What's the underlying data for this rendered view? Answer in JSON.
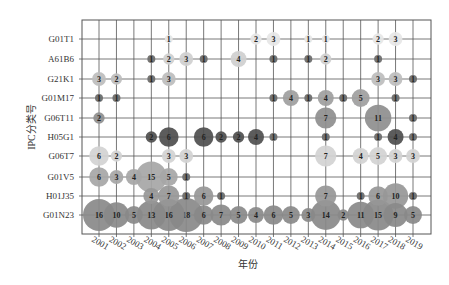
{
  "chart_data": {
    "type": "scatter",
    "subtype": "bubble",
    "title": "",
    "xlabel": "年份",
    "ylabel": "IPC分类号",
    "grid": true,
    "categories_x": [
      "2001",
      "2002",
      "2003",
      "2004",
      "2005",
      "2006",
      "2007",
      "2008",
      "2009",
      "2010",
      "2011",
      "2012",
      "2013",
      "2014",
      "2015",
      "2016",
      "2017",
      "2018",
      "2019"
    ],
    "categories_y": [
      "G01T1",
      "A61B6",
      "G21K1",
      "G01M17",
      "G06T11",
      "H05G1",
      "G06T7",
      "G01V5",
      "H01J35",
      "G01N23"
    ],
    "series": [
      {
        "name": "G01T1",
        "color": "#e6e6e6",
        "points": [
          [
            "2005",
            1
          ],
          [
            "2010",
            2
          ],
          [
            "2011",
            3
          ],
          [
            "2013",
            1
          ],
          [
            "2014",
            1
          ],
          [
            "2017",
            2
          ],
          [
            "2018",
            3
          ]
        ]
      },
      {
        "name": "A61B6",
        "color": "#cfcfcf",
        "points": [
          [
            "2004",
            1
          ],
          [
            "2005",
            2
          ],
          [
            "2006",
            3
          ],
          [
            "2007",
            1
          ],
          [
            "2009",
            4
          ],
          [
            "2011",
            1
          ],
          [
            "2013",
            1
          ],
          [
            "2014",
            2
          ],
          [
            "2017",
            1
          ]
        ]
      },
      {
        "name": "G21K1",
        "color": "#bdbdbd",
        "points": [
          [
            "2001",
            3
          ],
          [
            "2002",
            2
          ],
          [
            "2004",
            1
          ],
          [
            "2005",
            3
          ],
          [
            "2017",
            3
          ],
          [
            "2018",
            3
          ],
          [
            "2019",
            1
          ]
        ]
      },
      {
        "name": "G01M17",
        "color": "#9e9e9e",
        "points": [
          [
            "2001",
            1
          ],
          [
            "2002",
            1
          ],
          [
            "2011",
            1
          ],
          [
            "2012",
            4
          ],
          [
            "2013",
            1
          ],
          [
            "2014",
            4
          ],
          [
            "2015",
            1
          ],
          [
            "2016",
            5
          ],
          [
            "2018",
            1
          ]
        ]
      },
      {
        "name": "G06T11",
        "color": "#8e8e8e",
        "points": [
          [
            "2001",
            2
          ],
          [
            "2014",
            7
          ],
          [
            "2017",
            11
          ],
          [
            "2019",
            1
          ]
        ]
      },
      {
        "name": "H05G1",
        "color": "#4e4e4e",
        "points": [
          [
            "2004",
            2
          ],
          [
            "2005",
            6
          ],
          [
            "2007",
            6
          ],
          [
            "2008",
            2
          ],
          [
            "2009",
            2
          ],
          [
            "2010",
            4
          ],
          [
            "2011",
            1
          ],
          [
            "2014",
            1
          ],
          [
            "2017",
            1
          ],
          [
            "2018",
            4
          ],
          [
            "2019",
            1
          ]
        ]
      },
      {
        "name": "G06T7",
        "color": "#d2d2d2",
        "points": [
          [
            "2001",
            6
          ],
          [
            "2002",
            2
          ],
          [
            "2005",
            3
          ],
          [
            "2006",
            3
          ],
          [
            "2014",
            7
          ],
          [
            "2016",
            4
          ],
          [
            "2017",
            5
          ],
          [
            "2018",
            3
          ],
          [
            "2019",
            3
          ]
        ]
      },
      {
        "name": "G01V5",
        "color": "#a6a6a6",
        "points": [
          [
            "2001",
            6
          ],
          [
            "2002",
            3
          ],
          [
            "2003",
            4
          ],
          [
            "2004",
            15
          ],
          [
            "2005",
            5
          ],
          [
            "2006",
            1
          ]
        ]
      },
      {
        "name": "H01J35",
        "color": "#979797",
        "points": [
          [
            "2004",
            4
          ],
          [
            "2005",
            7
          ],
          [
            "2006",
            1
          ],
          [
            "2007",
            6
          ],
          [
            "2008",
            1
          ],
          [
            "2014",
            7
          ],
          [
            "2016",
            1
          ],
          [
            "2017",
            6
          ],
          [
            "2018",
            10
          ],
          [
            "2019",
            1
          ]
        ]
      },
      {
        "name": "G01N23",
        "color": "#898989",
        "points": [
          [
            "2001",
            16
          ],
          [
            "2002",
            10
          ],
          [
            "2003",
            5
          ],
          [
            "2004",
            13
          ],
          [
            "2005",
            16
          ],
          [
            "2006",
            18
          ],
          [
            "2007",
            6
          ],
          [
            "2008",
            7
          ],
          [
            "2009",
            5
          ],
          [
            "2010",
            4
          ],
          [
            "2011",
            6
          ],
          [
            "2012",
            5
          ],
          [
            "2013",
            3
          ],
          [
            "2014",
            14
          ],
          [
            "2015",
            2
          ],
          [
            "2016",
            11
          ],
          [
            "2017",
            15
          ],
          [
            "2018",
            9
          ],
          [
            "2019",
            5
          ]
        ]
      }
    ]
  }
}
